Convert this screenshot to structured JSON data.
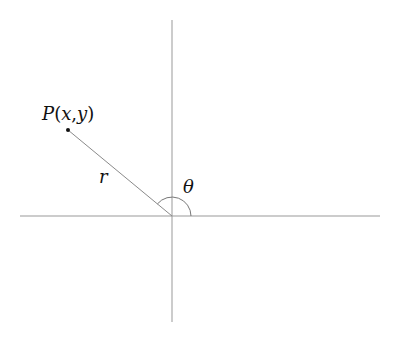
{
  "diagram": {
    "point_label": "P(x,y)",
    "point_label_parts": {
      "P": "P",
      "open": "(",
      "x": "x",
      "comma": ",",
      "y": "y",
      "close": ")"
    },
    "radius_label": "r",
    "angle_label": "θ",
    "colors": {
      "axis": "#999999",
      "segment": "#8a8a8a",
      "arc": "#777777",
      "point": "#111111",
      "text": "#111111"
    }
  }
}
